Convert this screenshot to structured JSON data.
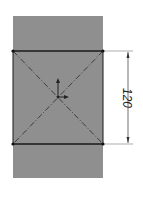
{
  "sketch": {
    "part_fill": "#8f8f8f",
    "dimension": {
      "label": "120",
      "orientation": "vertical"
    },
    "colors": {
      "edge": "#1a1a1a",
      "construction": "#2a2a2a",
      "dimension": "#333333"
    }
  }
}
